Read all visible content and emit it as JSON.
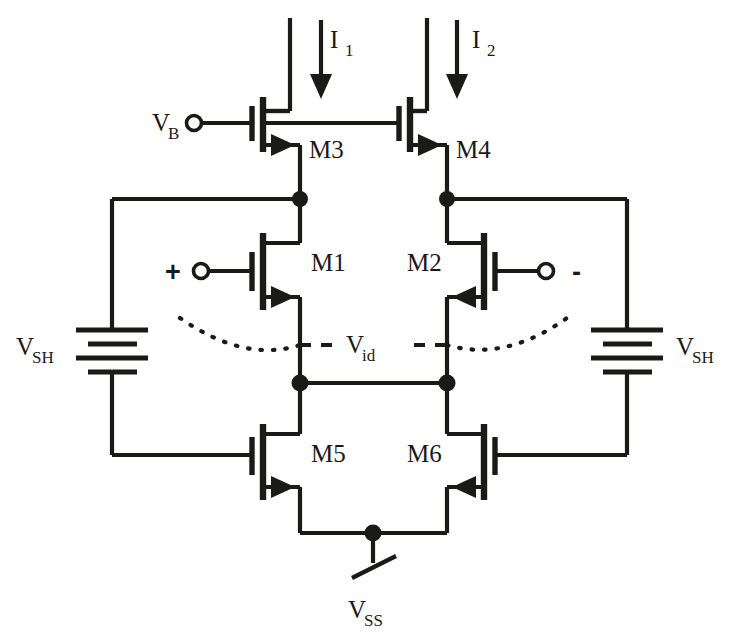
{
  "figure": {
    "type": "mosfet-circuit-schematic",
    "title": "",
    "background_color": "#ffffff",
    "ink_color": "#1a1a18"
  },
  "labels": {
    "current_1": "I",
    "current_1_sub": "1",
    "current_2": "I",
    "current_2_sub": "2",
    "bias_v": "V",
    "bias_v_sub": "B",
    "m3": "M3",
    "m4": "M4",
    "m1": "M1",
    "m2": "M2",
    "m5": "M5",
    "m6": "M6",
    "vsh_left": "V",
    "vsh_left_sub": "SH",
    "vsh_right": "V",
    "vsh_right_sub": "SH",
    "vid": "V",
    "vid_sub": "id",
    "vss": "V",
    "vss_sub": "SS",
    "plus_input": "+",
    "minus_input": "-"
  },
  "components": [
    {
      "name": "M3",
      "kind": "mosfet",
      "label": "M3",
      "orientation": "left-gate",
      "arrow": "source-right"
    },
    {
      "name": "M4",
      "kind": "mosfet",
      "label": "M4",
      "orientation": "left-gate",
      "arrow": "source-right"
    },
    {
      "name": "M1",
      "kind": "mosfet",
      "label": "M1",
      "orientation": "left-gate",
      "arrow": "source-right"
    },
    {
      "name": "M2",
      "kind": "mosfet",
      "label": "M2",
      "orientation": "right-gate",
      "arrow": "source-left"
    },
    {
      "name": "M5",
      "kind": "mosfet",
      "label": "M5",
      "orientation": "left-gate",
      "arrow": "source-right"
    },
    {
      "name": "M6",
      "kind": "mosfet",
      "label": "M6",
      "orientation": "right-gate",
      "arrow": "source-left"
    },
    {
      "name": "VSH-left",
      "kind": "battery",
      "label": "VSH",
      "plates": 4
    },
    {
      "name": "VSH-right",
      "kind": "battery",
      "label": "VSH",
      "plates": 4
    },
    {
      "name": "VSS-terminal",
      "kind": "ground-slash",
      "label": "VSS"
    },
    {
      "name": "VB-terminal",
      "kind": "open-circle",
      "label": "VB"
    },
    {
      "name": "plus-input-terminal",
      "kind": "open-circle",
      "label": "+"
    },
    {
      "name": "minus-input-terminal",
      "kind": "open-circle",
      "label": "-"
    },
    {
      "name": "I1-arrow",
      "kind": "current-arrow",
      "label": "I1",
      "direction": "down"
    },
    {
      "name": "I2-arrow",
      "kind": "current-arrow",
      "label": "I2",
      "direction": "down"
    },
    {
      "name": "Vid-dotted-curve",
      "kind": "annotation-curve",
      "label": "Vid"
    }
  ]
}
